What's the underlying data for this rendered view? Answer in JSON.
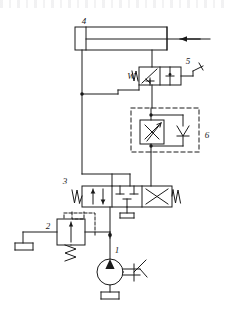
{
  "figure": {
    "type": "hydraulic-schematic",
    "stroke_color": "#1a1a1a",
    "background_color": "#ffffff",
    "width": 228,
    "height": 310
  },
  "callouts": [
    {
      "id": "c1",
      "label": "1",
      "component": "pump-with-drive",
      "x": 117,
      "y": 253
    },
    {
      "id": "c2",
      "label": "2",
      "component": "pressure-relief-valve",
      "x": 48,
      "y": 229
    },
    {
      "id": "c3",
      "label": "3",
      "component": "directional-control-valve",
      "x": 65,
      "y": 184
    },
    {
      "id": "c4",
      "label": "4",
      "component": "double-acting-cylinder",
      "x": 84,
      "y": 24
    },
    {
      "id": "c5",
      "label": "5",
      "component": "two-position-valve",
      "x": 188,
      "y": 64
    },
    {
      "id": "c6",
      "label": "6",
      "component": "throttle-check-valve-unit",
      "x": 207,
      "y": 138
    }
  ],
  "components": {
    "cylinder": {
      "name": "4",
      "description": "double-acting cylinder",
      "body": {
        "x": 75,
        "y": 27,
        "w": 92,
        "h": 23
      },
      "cap": {
        "x": 75,
        "y": 27,
        "w": 11,
        "h": 23
      },
      "rod_y": 39,
      "rod_end_x": 210,
      "arrow_direction": "left",
      "port_left_x": 82,
      "port_right_x": 152
    },
    "valve5": {
      "name": "5",
      "description": "two-position two-way valve, spring return, lever actuated",
      "box": {
        "x": 139,
        "y": 67,
        "w": 42,
        "h": 18
      },
      "spring_label": "W",
      "actuator": "lever"
    },
    "unit6": {
      "name": "6",
      "description": "throttle valve with parallel check valve in dashed enclosure",
      "dashed_box": {
        "x": 131,
        "y": 108,
        "w": 68,
        "h": 44
      },
      "throttle_box": {
        "x": 140,
        "y": 120,
        "w": 26,
        "h": 24
      },
      "check_valve_x": 183
    },
    "valve3": {
      "name": "3",
      "description": "three-position four-way directional control valve",
      "box": {
        "x": 82,
        "y": 186,
        "w": 90,
        "h": 21
      },
      "positions": 3,
      "left_actuator": "W",
      "right_actuator": "W"
    },
    "relief2": {
      "name": "2",
      "description": "pressure relief valve with spring and pilot line",
      "box": {
        "x": 57,
        "y": 219,
        "w": 28,
        "h": 26
      },
      "spring": "below",
      "pilot": "dashed"
    },
    "pump1": {
      "name": "1",
      "description": "fixed displacement pump with prime mover",
      "center": {
        "x": 110,
        "y": 272
      },
      "radius": 13
    },
    "reservoirs": [
      {
        "name": "tank-left",
        "x": 23,
        "y": 243
      },
      {
        "name": "tank-pump",
        "x": 110,
        "y": 292
      },
      {
        "name": "tank-valve3",
        "x": 127,
        "y": 215
      }
    ]
  },
  "nodes": [
    {
      "name": "junction-left-rail",
      "x": 82,
      "y": 94
    },
    {
      "name": "junction-unit6-top",
      "x": 151,
      "y": 115
    },
    {
      "name": "junction-unit6-bot",
      "x": 151,
      "y": 146
    },
    {
      "name": "junction-pump-line",
      "x": 110,
      "y": 235
    }
  ]
}
